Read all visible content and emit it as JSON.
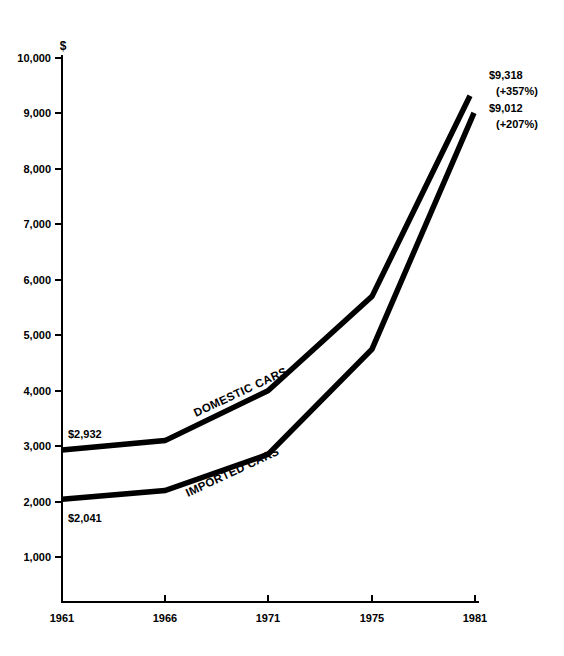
{
  "chart_data": {
    "type": "line",
    "title": "",
    "subtitle": "",
    "xlabel": "",
    "ylabel": "",
    "unit_symbol": "$",
    "grid": false,
    "legend_position": "inline",
    "x": [
      "1961",
      "1966",
      "1971",
      "1975",
      "1981"
    ],
    "categories": [
      "1961",
      "1966",
      "1971",
      "1975",
      "1981"
    ],
    "xlim": [
      1961,
      1981
    ],
    "ylim": [
      0,
      10000
    ],
    "ytick_labels": [
      "10,000",
      "9,000",
      "8,000",
      "7,000",
      "6,000",
      "5,000",
      "4,000",
      "3,000",
      "2,000",
      "1,000"
    ],
    "ytick_values": [
      10000,
      9000,
      8000,
      7000,
      6000,
      5000,
      4000,
      3000,
      2000,
      1000
    ],
    "xtick_labels": [
      "1961",
      "1966",
      "1971",
      "1975",
      "1981"
    ],
    "series": [
      {
        "name": "DOMESTIC CARS",
        "values": [
          2932,
          3100,
          4000,
          5700,
          9318
        ],
        "start_label": "$2,932",
        "end_label": "$9,318",
        "end_pct": "(+357%)"
      },
      {
        "name": "IMPORTED CARS",
        "values": [
          2041,
          2200,
          2850,
          4750,
          9012
        ],
        "start_label": "$2,041",
        "end_label": "$9,012",
        "end_pct": "(+207%)"
      }
    ],
    "annotations": [
      {
        "text": "$2,932",
        "series": "DOMESTIC CARS",
        "position": "start-above"
      },
      {
        "text": "$2,041",
        "series": "IMPORTED CARS",
        "position": "start-below"
      },
      {
        "text": "$9,318",
        "series": "DOMESTIC CARS",
        "position": "end-upper"
      },
      {
        "text": "(+357%)",
        "series": "DOMESTIC CARS",
        "position": "end-upper-sub"
      },
      {
        "text": "$9,012",
        "series": "IMPORTED CARS",
        "position": "end-lower"
      },
      {
        "text": "(+207%)",
        "series": "IMPORTED CARS",
        "position": "end-lower-sub"
      }
    ]
  }
}
